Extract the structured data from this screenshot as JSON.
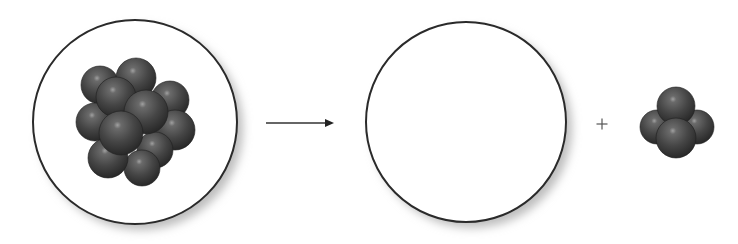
{
  "diagram": {
    "type": "reaction-equation",
    "colors": {
      "background": "#ffffff",
      "circle_stroke": "#2a2a2a",
      "circle_fill": "#ffffff",
      "shadow": "#b8b8b8",
      "sphere_dark": "#2e2e2e",
      "sphere_mid": "#555555",
      "sphere_light": "#9a9a9a",
      "arrow": "#333333",
      "plus": "#555555"
    },
    "parent_nucleus": {
      "label": "parent nucleus",
      "circle": {
        "cx": 135,
        "cy": 122,
        "r": 102
      },
      "spheres": [
        {
          "cx": 100,
          "cy": 85,
          "r": 19
        },
        {
          "cx": 136,
          "cy": 78,
          "r": 20
        },
        {
          "cx": 170,
          "cy": 100,
          "r": 19
        },
        {
          "cx": 175,
          "cy": 130,
          "r": 20
        },
        {
          "cx": 95,
          "cy": 122,
          "r": 19
        },
        {
          "cx": 155,
          "cy": 150,
          "r": 18
        },
        {
          "cx": 142,
          "cy": 168,
          "r": 18
        },
        {
          "cx": 108,
          "cy": 158,
          "r": 20
        },
        {
          "cx": 116,
          "cy": 97,
          "r": 20
        },
        {
          "cx": 146,
          "cy": 112,
          "r": 22
        },
        {
          "cx": 121,
          "cy": 133,
          "r": 22
        }
      ]
    },
    "arrow": {
      "label": "decays to",
      "x1": 266,
      "y1": 123,
      "x2": 334,
      "y2": 123
    },
    "daughter_nucleus": {
      "label": "daughter nucleus (blank)",
      "circle": {
        "cx": 466,
        "cy": 122,
        "r": 100
      },
      "spheres": []
    },
    "plus": {
      "label": "+",
      "cx": 602,
      "cy": 124,
      "size": 11
    },
    "alpha_particle": {
      "label": "alpha particle",
      "spheres": [
        {
          "cx": 657,
          "cy": 127,
          "r": 17
        },
        {
          "cx": 697,
          "cy": 127,
          "r": 17
        },
        {
          "cx": 676,
          "cy": 106,
          "r": 19
        },
        {
          "cx": 676,
          "cy": 138,
          "r": 20
        }
      ]
    }
  }
}
